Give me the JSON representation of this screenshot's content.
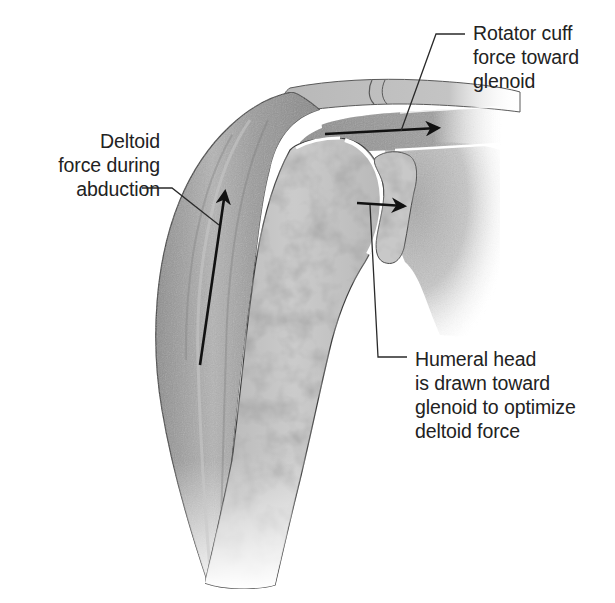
{
  "figure": {
    "colors": {
      "background": "#ffffff",
      "text": "#222222",
      "leader_line": "#2a2a2a",
      "force_arrow": "#111111",
      "muscle_fill": "#9a9a9a",
      "muscle_highlight": "#bdbdbd",
      "bone_fill": "#c4c4c4",
      "bone_mottle": "#a8a8a8",
      "outline": "#4a4a4a"
    }
  },
  "labels": {
    "rotator_cuff": {
      "lines": [
        "Rotator cuff",
        "force toward",
        "glenoid"
      ]
    },
    "deltoid": {
      "lines": [
        "Deltoid",
        "force during",
        "abduction"
      ]
    },
    "humeral_head": {
      "lines": [
        "Humeral head",
        "is drawn toward",
        "glenoid to optimize",
        "deltoid force"
      ]
    }
  },
  "structures": [
    {
      "name": "deltoid-muscle"
    },
    {
      "name": "humerus"
    },
    {
      "name": "humeral-head"
    },
    {
      "name": "glenoid"
    },
    {
      "name": "scapula"
    },
    {
      "name": "acromion"
    },
    {
      "name": "clavicle"
    },
    {
      "name": "rotator-cuff-tendon"
    }
  ],
  "arrows": [
    {
      "name": "deltoid-force-arrow",
      "direction": "up"
    },
    {
      "name": "rotator-cuff-force-arrow",
      "direction": "right"
    },
    {
      "name": "humeral-head-translation-arrow",
      "direction": "right"
    }
  ]
}
